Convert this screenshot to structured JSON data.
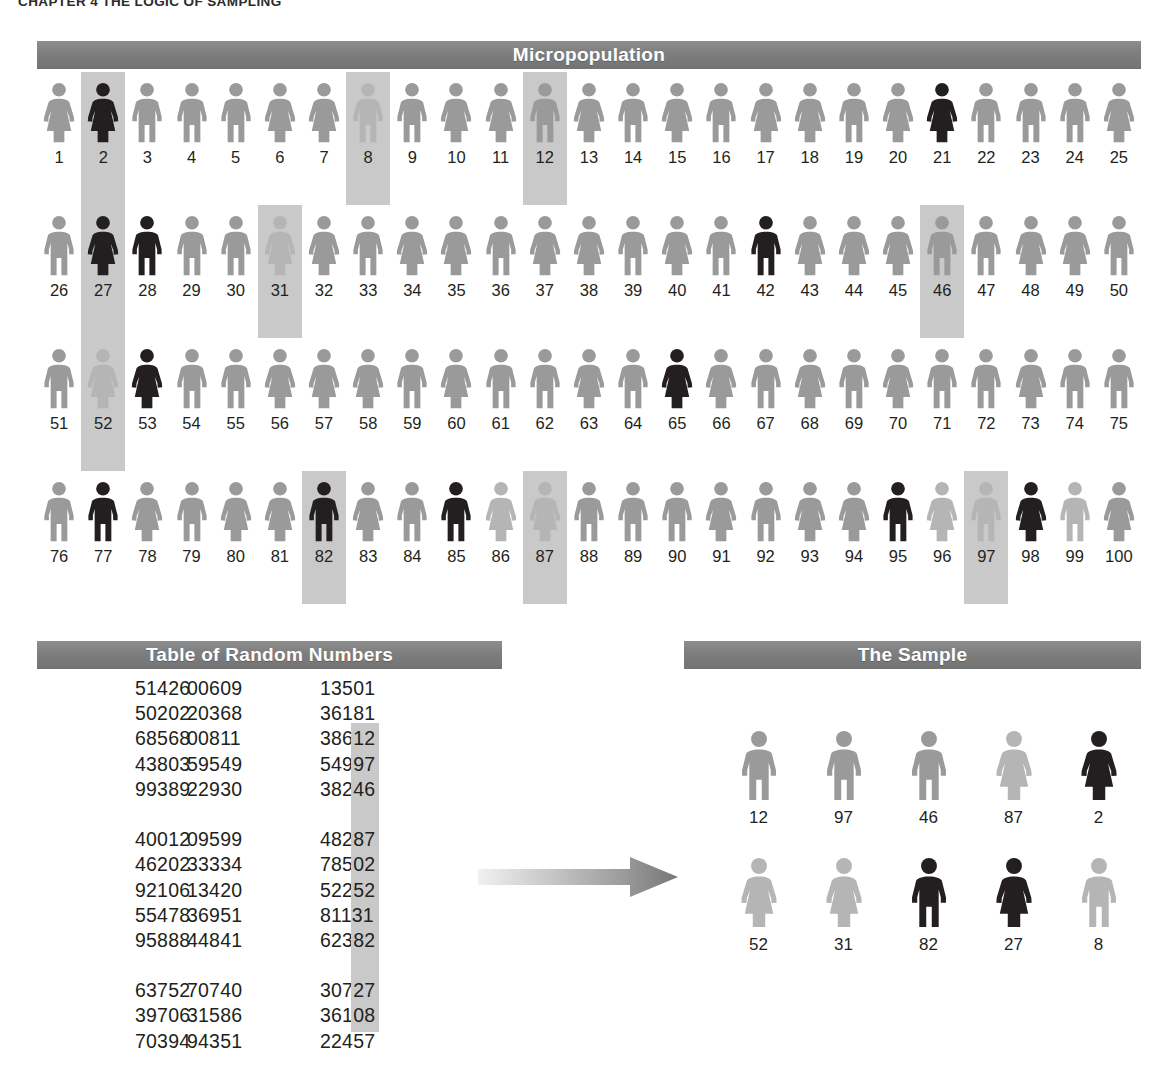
{
  "running_head": "CHAPTER 4   THE LOGIC OF SAMPLING",
  "colors": {
    "banner": "#7d7d7d",
    "highlight": "#c9c9c9",
    "figure_gray": "#9a9a9a",
    "figure_light_gray": "#b5b5b5",
    "figure_dark": "#231f20",
    "text": "#231f20"
  },
  "micropopulation": {
    "banner_label": "Micropopulation",
    "rows": [
      [
        {
          "id": "1",
          "sex": "female",
          "shade": "gray",
          "highlighted": false
        },
        {
          "id": "2",
          "sex": "female",
          "shade": "dark",
          "highlighted": true
        },
        {
          "id": "3",
          "sex": "male",
          "shade": "gray",
          "highlighted": false
        },
        {
          "id": "4",
          "sex": "male",
          "shade": "gray",
          "highlighted": false
        },
        {
          "id": "5",
          "sex": "male",
          "shade": "gray",
          "highlighted": false
        },
        {
          "id": "6",
          "sex": "female",
          "shade": "gray",
          "highlighted": false
        },
        {
          "id": "7",
          "sex": "female",
          "shade": "gray",
          "highlighted": false
        },
        {
          "id": "8",
          "sex": "male",
          "shade": "light",
          "highlighted": true
        },
        {
          "id": "9",
          "sex": "male",
          "shade": "gray",
          "highlighted": false
        },
        {
          "id": "10",
          "sex": "female",
          "shade": "gray",
          "highlighted": false
        },
        {
          "id": "11",
          "sex": "female",
          "shade": "gray",
          "highlighted": false
        },
        {
          "id": "12",
          "sex": "male",
          "shade": "gray",
          "highlighted": true
        },
        {
          "id": "13",
          "sex": "female",
          "shade": "gray",
          "highlighted": false
        },
        {
          "id": "14",
          "sex": "male",
          "shade": "gray",
          "highlighted": false
        },
        {
          "id": "15",
          "sex": "female",
          "shade": "gray",
          "highlighted": false
        },
        {
          "id": "16",
          "sex": "male",
          "shade": "gray",
          "highlighted": false
        },
        {
          "id": "17",
          "sex": "female",
          "shade": "gray",
          "highlighted": false
        },
        {
          "id": "18",
          "sex": "female",
          "shade": "gray",
          "highlighted": false
        },
        {
          "id": "19",
          "sex": "male",
          "shade": "gray",
          "highlighted": false
        },
        {
          "id": "20",
          "sex": "female",
          "shade": "gray",
          "highlighted": false
        },
        {
          "id": "21",
          "sex": "female",
          "shade": "dark",
          "highlighted": false
        },
        {
          "id": "22",
          "sex": "male",
          "shade": "gray",
          "highlighted": false
        },
        {
          "id": "23",
          "sex": "male",
          "shade": "gray",
          "highlighted": false
        },
        {
          "id": "24",
          "sex": "male",
          "shade": "gray",
          "highlighted": false
        },
        {
          "id": "25",
          "sex": "female",
          "shade": "gray",
          "highlighted": false
        }
      ],
      [
        {
          "id": "26",
          "sex": "male",
          "shade": "gray",
          "highlighted": false
        },
        {
          "id": "27",
          "sex": "female",
          "shade": "dark",
          "highlighted": true
        },
        {
          "id": "28",
          "sex": "male",
          "shade": "dark",
          "highlighted": false
        },
        {
          "id": "29",
          "sex": "male",
          "shade": "gray",
          "highlighted": false
        },
        {
          "id": "30",
          "sex": "male",
          "shade": "gray",
          "highlighted": false
        },
        {
          "id": "31",
          "sex": "female",
          "shade": "light",
          "highlighted": true
        },
        {
          "id": "32",
          "sex": "female",
          "shade": "gray",
          "highlighted": false
        },
        {
          "id": "33",
          "sex": "male",
          "shade": "gray",
          "highlighted": false
        },
        {
          "id": "34",
          "sex": "female",
          "shade": "gray",
          "highlighted": false
        },
        {
          "id": "35",
          "sex": "female",
          "shade": "gray",
          "highlighted": false
        },
        {
          "id": "36",
          "sex": "male",
          "shade": "gray",
          "highlighted": false
        },
        {
          "id": "37",
          "sex": "female",
          "shade": "gray",
          "highlighted": false
        },
        {
          "id": "38",
          "sex": "female",
          "shade": "gray",
          "highlighted": false
        },
        {
          "id": "39",
          "sex": "male",
          "shade": "gray",
          "highlighted": false
        },
        {
          "id": "40",
          "sex": "female",
          "shade": "gray",
          "highlighted": false
        },
        {
          "id": "41",
          "sex": "male",
          "shade": "gray",
          "highlighted": false
        },
        {
          "id": "42",
          "sex": "male",
          "shade": "dark",
          "highlighted": false
        },
        {
          "id": "43",
          "sex": "female",
          "shade": "gray",
          "highlighted": false
        },
        {
          "id": "44",
          "sex": "female",
          "shade": "gray",
          "highlighted": false
        },
        {
          "id": "45",
          "sex": "female",
          "shade": "gray",
          "highlighted": false
        },
        {
          "id": "46",
          "sex": "male",
          "shade": "gray",
          "highlighted": true
        },
        {
          "id": "47",
          "sex": "male",
          "shade": "gray",
          "highlighted": false
        },
        {
          "id": "48",
          "sex": "female",
          "shade": "gray",
          "highlighted": false
        },
        {
          "id": "49",
          "sex": "female",
          "shade": "gray",
          "highlighted": false
        },
        {
          "id": "50",
          "sex": "male",
          "shade": "gray",
          "highlighted": false
        }
      ],
      [
        {
          "id": "51",
          "sex": "male",
          "shade": "gray",
          "highlighted": false
        },
        {
          "id": "52",
          "sex": "female",
          "shade": "light",
          "highlighted": true
        },
        {
          "id": "53",
          "sex": "female",
          "shade": "dark",
          "highlighted": false
        },
        {
          "id": "54",
          "sex": "male",
          "shade": "gray",
          "highlighted": false
        },
        {
          "id": "55",
          "sex": "male",
          "shade": "gray",
          "highlighted": false
        },
        {
          "id": "56",
          "sex": "female",
          "shade": "gray",
          "highlighted": false
        },
        {
          "id": "57",
          "sex": "female",
          "shade": "gray",
          "highlighted": false
        },
        {
          "id": "58",
          "sex": "female",
          "shade": "gray",
          "highlighted": false
        },
        {
          "id": "59",
          "sex": "male",
          "shade": "gray",
          "highlighted": false
        },
        {
          "id": "60",
          "sex": "female",
          "shade": "gray",
          "highlighted": false
        },
        {
          "id": "61",
          "sex": "male",
          "shade": "gray",
          "highlighted": false
        },
        {
          "id": "62",
          "sex": "male",
          "shade": "gray",
          "highlighted": false
        },
        {
          "id": "63",
          "sex": "female",
          "shade": "gray",
          "highlighted": false
        },
        {
          "id": "64",
          "sex": "male",
          "shade": "gray",
          "highlighted": false
        },
        {
          "id": "65",
          "sex": "female",
          "shade": "dark",
          "highlighted": false
        },
        {
          "id": "66",
          "sex": "female",
          "shade": "gray",
          "highlighted": false
        },
        {
          "id": "67",
          "sex": "male",
          "shade": "gray",
          "highlighted": false
        },
        {
          "id": "68",
          "sex": "female",
          "shade": "gray",
          "highlighted": false
        },
        {
          "id": "69",
          "sex": "male",
          "shade": "gray",
          "highlighted": false
        },
        {
          "id": "70",
          "sex": "female",
          "shade": "gray",
          "highlighted": false
        },
        {
          "id": "71",
          "sex": "male",
          "shade": "gray",
          "highlighted": false
        },
        {
          "id": "72",
          "sex": "male",
          "shade": "gray",
          "highlighted": false
        },
        {
          "id": "73",
          "sex": "female",
          "shade": "gray",
          "highlighted": false
        },
        {
          "id": "74",
          "sex": "male",
          "shade": "gray",
          "highlighted": false
        },
        {
          "id": "75",
          "sex": "male",
          "shade": "gray",
          "highlighted": false
        }
      ],
      [
        {
          "id": "76",
          "sex": "male",
          "shade": "gray",
          "highlighted": false
        },
        {
          "id": "77",
          "sex": "male",
          "shade": "dark",
          "highlighted": false
        },
        {
          "id": "78",
          "sex": "female",
          "shade": "gray",
          "highlighted": false
        },
        {
          "id": "79",
          "sex": "male",
          "shade": "gray",
          "highlighted": false
        },
        {
          "id": "80",
          "sex": "female",
          "shade": "gray",
          "highlighted": false
        },
        {
          "id": "81",
          "sex": "female",
          "shade": "gray",
          "highlighted": false
        },
        {
          "id": "82",
          "sex": "male",
          "shade": "dark",
          "highlighted": true
        },
        {
          "id": "83",
          "sex": "female",
          "shade": "gray",
          "highlighted": false
        },
        {
          "id": "84",
          "sex": "male",
          "shade": "gray",
          "highlighted": false
        },
        {
          "id": "85",
          "sex": "male",
          "shade": "dark",
          "highlighted": false
        },
        {
          "id": "86",
          "sex": "female",
          "shade": "light",
          "highlighted": false
        },
        {
          "id": "87",
          "sex": "female",
          "shade": "light",
          "highlighted": true
        },
        {
          "id": "88",
          "sex": "male",
          "shade": "gray",
          "highlighted": false
        },
        {
          "id": "89",
          "sex": "male",
          "shade": "gray",
          "highlighted": false
        },
        {
          "id": "90",
          "sex": "male",
          "shade": "gray",
          "highlighted": false
        },
        {
          "id": "91",
          "sex": "female",
          "shade": "gray",
          "highlighted": false
        },
        {
          "id": "92",
          "sex": "male",
          "shade": "gray",
          "highlighted": false
        },
        {
          "id": "93",
          "sex": "female",
          "shade": "gray",
          "highlighted": false
        },
        {
          "id": "94",
          "sex": "female",
          "shade": "gray",
          "highlighted": false
        },
        {
          "id": "95",
          "sex": "male",
          "shade": "dark",
          "highlighted": false
        },
        {
          "id": "96",
          "sex": "female",
          "shade": "light",
          "highlighted": false
        },
        {
          "id": "97",
          "sex": "male",
          "shade": "light",
          "highlighted": true
        },
        {
          "id": "98",
          "sex": "female",
          "shade": "dark",
          "highlighted": false
        },
        {
          "id": "99",
          "sex": "male",
          "shade": "light",
          "highlighted": false
        },
        {
          "id": "100",
          "sex": "female",
          "shade": "gray",
          "highlighted": false
        }
      ]
    ]
  },
  "random_table": {
    "banner_label": "Table of Random Numbers",
    "blocks": [
      [
        {
          "c1": "51426",
          "c2": "00609",
          "c3_head": "135",
          "c3_tail": "01",
          "tail_highlighted": false
        },
        {
          "c1": "50202",
          "c2": "20368",
          "c3_head": "361",
          "c3_tail": "81",
          "tail_highlighted": false
        },
        {
          "c1": "68568",
          "c2": "00811",
          "c3_head": "386",
          "c3_tail": "12",
          "tail_highlighted": true
        },
        {
          "c1": "43803",
          "c2": "59549",
          "c3_head": "549",
          "c3_tail": "97",
          "tail_highlighted": true
        },
        {
          "c1": "99389",
          "c2": "22930",
          "c3_head": "382",
          "c3_tail": "46",
          "tail_highlighted": true
        }
      ],
      [
        {
          "c1": "40012",
          "c2": "09599",
          "c3_head": "482",
          "c3_tail": "87",
          "tail_highlighted": true
        },
        {
          "c1": "46202",
          "c2": "33334",
          "c3_head": "785",
          "c3_tail": "02",
          "tail_highlighted": true
        },
        {
          "c1": "92106",
          "c2": "13420",
          "c3_head": "522",
          "c3_tail": "52",
          "tail_highlighted": true
        },
        {
          "c1": "55478",
          "c2": "36951",
          "c3_head": "811",
          "c3_tail": "31",
          "tail_highlighted": true
        },
        {
          "c1": "95888",
          "c2": "44841",
          "c3_head": "623",
          "c3_tail": "82",
          "tail_highlighted": true
        }
      ],
      [
        {
          "c1": "63752",
          "c2": "70740",
          "c3_head": "307",
          "c3_tail": "27",
          "tail_highlighted": true
        },
        {
          "c1": "39706",
          "c2": "31586",
          "c3_head": "361",
          "c3_tail": "08",
          "tail_highlighted": true
        },
        {
          "c1": "70394",
          "c2": "94351",
          "c3_head": "224",
          "c3_tail": "57",
          "tail_highlighted": false
        }
      ]
    ]
  },
  "sample": {
    "banner_label": "The Sample",
    "rows": [
      [
        {
          "id": "12",
          "sex": "male",
          "shade": "gray"
        },
        {
          "id": "97",
          "sex": "male",
          "shade": "gray"
        },
        {
          "id": "46",
          "sex": "male",
          "shade": "gray"
        },
        {
          "id": "87",
          "sex": "female",
          "shade": "light"
        },
        {
          "id": "2",
          "sex": "female",
          "shade": "dark"
        }
      ],
      [
        {
          "id": "52",
          "sex": "female",
          "shade": "light"
        },
        {
          "id": "31",
          "sex": "female",
          "shade": "light"
        },
        {
          "id": "82",
          "sex": "male",
          "shade": "dark"
        },
        {
          "id": "27",
          "sex": "female",
          "shade": "dark"
        },
        {
          "id": "8",
          "sex": "male",
          "shade": "light"
        }
      ]
    ]
  },
  "arrow": {
    "name": "process-arrow",
    "direction": "right"
  }
}
